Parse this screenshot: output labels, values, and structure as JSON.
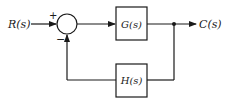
{
  "diagram": {
    "type": "negative feedback control loop",
    "input": {
      "label": "R(s)"
    },
    "output": {
      "label": "C(s)"
    },
    "summing_junction": {
      "plus_sign": "+",
      "minus_sign": "−"
    },
    "forward_block": {
      "label": "G(s)"
    },
    "feedback_block": {
      "label": "H(s)"
    },
    "colors": {
      "stroke": "#1a1a1a",
      "background": "#ffffff"
    }
  }
}
